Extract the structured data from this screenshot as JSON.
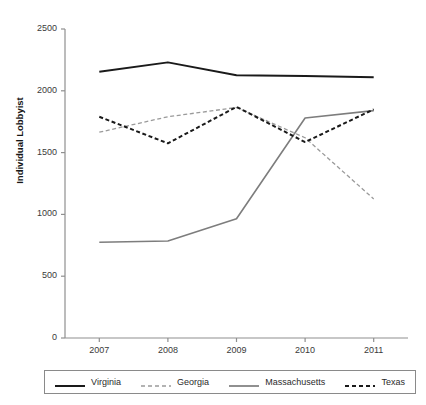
{
  "chart_data": {
    "type": "line",
    "title": "",
    "subtitle": "",
    "xlabel": "",
    "ylabel": "Individual Lobbyist",
    "x": [
      2007,
      2008,
      2009,
      2010,
      2011
    ],
    "categories": [
      "2007",
      "2008",
      "2009",
      "2010",
      "2011"
    ],
    "xtick_labels": [
      "2007",
      "2008",
      "2009",
      "2010",
      "2011"
    ],
    "ytick_labels": [
      "0",
      "500",
      "1000",
      "1500",
      "2000",
      "2500"
    ],
    "yticks": [
      0,
      500,
      1000,
      1500,
      2000,
      2500
    ],
    "ylim": [
      0,
      2500
    ],
    "xlim": [
      2006.5,
      2011.5
    ],
    "grid": false,
    "legend_position": "bottom",
    "series": [
      {
        "name": "Virginia",
        "values": [
          2155,
          2230,
          2125,
          2120,
          2110
        ],
        "color": "#1a1a1a",
        "style": "solid",
        "width": 2.0
      },
      {
        "name": "Georgia",
        "values": [
          1665,
          1790,
          1865,
          1620,
          1125
        ],
        "color": "#9a9a9a",
        "style": "dashed",
        "width": 1.3
      },
      {
        "name": "Massachusetts",
        "values": [
          775,
          785,
          965,
          1780,
          1840
        ],
        "color": "#7d7d7d",
        "style": "solid",
        "width": 1.6
      },
      {
        "name": "Texas",
        "values": [
          1790,
          1575,
          1870,
          1585,
          1850
        ],
        "color": "#1a1a1a",
        "style": "dashed",
        "width": 2.0
      }
    ]
  },
  "legend": {
    "entries": [
      {
        "label": "Virginia"
      },
      {
        "label": "Georgia"
      },
      {
        "label": "Massachusetts"
      },
      {
        "label": "Texas"
      }
    ]
  },
  "axes": {
    "y_axis_label": "Individual Lobbyist"
  }
}
